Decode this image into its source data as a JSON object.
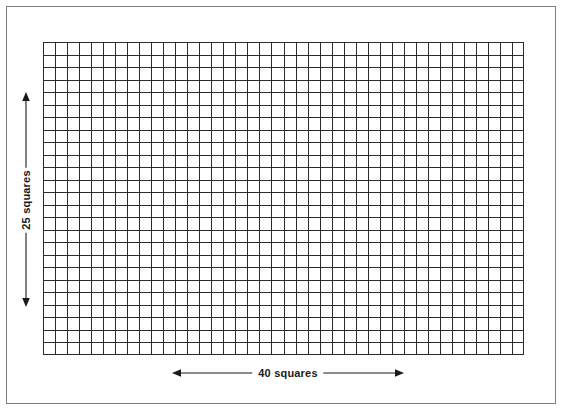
{
  "figure": {
    "background_color": "#ffffff",
    "frame": {
      "name": "outer-border",
      "color": "#7d7d7d"
    }
  },
  "grid": {
    "columns": 40,
    "rows": 25,
    "line_color": "#2b2b2b",
    "cell_fill": "#ffffff",
    "cell_width_px": 12.025,
    "cell_height_px": 12.52
  },
  "annotations": {
    "vertical": {
      "label": "25 squares",
      "orientation": "vertical",
      "arrow_style": "double-headed",
      "color": "#1a1a1a"
    },
    "horizontal": {
      "label": "40 squares",
      "orientation": "horizontal",
      "arrow_style": "double-headed",
      "color": "#1a1a1a"
    }
  },
  "chart_data": {
    "type": "table",
    "title": "",
    "categories": [
      "width",
      "height"
    ],
    "values": [
      40,
      25
    ],
    "xlabel": "40 squares",
    "ylabel": "25 squares",
    "total_squares": 1000
  }
}
